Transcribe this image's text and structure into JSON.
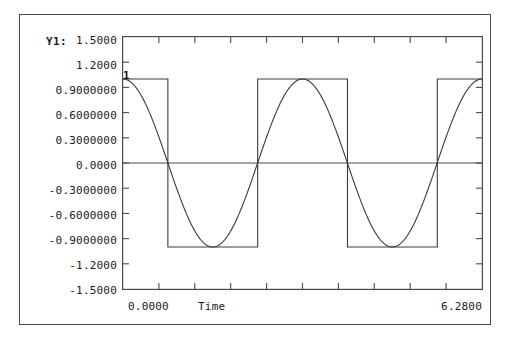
{
  "window": {
    "series_legend_label": "Y1:",
    "title": "Wal(4,theta),Cos(2*omega*theta).",
    "amplitude_marker": "1"
  },
  "axes": {
    "y_tick_labels": [
      "1.5000",
      "1.2000",
      "0.9000000",
      "0.6000000",
      "0.3000000",
      "0.0000",
      "-0.3000000",
      "-0.6000000",
      "-0.9000000",
      "-1.2000",
      "-1.5000"
    ],
    "x_min_label": "0.0000",
    "x_axis_title": "Time",
    "x_max_label": "6.2800"
  },
  "colors": {
    "frame": "#4a4a4a",
    "trace": "#333333",
    "text": "#1a1a1a",
    "background": "#ffffff"
  },
  "chart_data": {
    "type": "line",
    "title": "Wal(4,theta),Cos(2*omega*theta).",
    "xlabel": "Time",
    "ylabel": "Y1:",
    "xlim": [
      0.0,
      6.28
    ],
    "ylim": [
      -1.5,
      1.5
    ],
    "grid": false,
    "legend_position": "top-right",
    "y_ticks": [
      -1.5,
      -1.2,
      -0.9,
      -0.6,
      -0.3,
      0.0,
      0.3,
      0.6,
      0.9,
      1.2,
      1.5
    ],
    "y_tick_labels": [
      "-1.5000",
      "-1.2000",
      "-0.9000000",
      "-0.6000000",
      "-0.3000000",
      "0.0000",
      "0.3000000",
      "0.6000000",
      "0.9000000",
      "1.2000",
      "1.5000"
    ],
    "x_ticks": [
      0.0,
      0.628,
      1.256,
      1.884,
      2.512,
      3.14,
      3.768,
      4.396,
      5.024,
      5.652,
      6.28
    ],
    "x_tick_labels": [
      "0.0000",
      "",
      "",
      "",
      "",
      "",
      "",
      "",
      "",
      "",
      "6.2800"
    ],
    "series": [
      {
        "name": "Wal(4,theta)",
        "kind": "square",
        "amplitude": 1.0,
        "cycles": 2,
        "description": "Walsh function order 4: square wave alternating +1 / -1, transitions at theta = pi/4, 3pi/4, 5pi/4, 7pi/4 of each of 2 cycles",
        "transitions_x": [
          0.785,
          2.356,
          3.927,
          5.498
        ],
        "values_at_transitions": [
          1,
          -1,
          1,
          -1,
          1
        ]
      },
      {
        "name": "Cos(2*omega*theta)",
        "kind": "cosine",
        "amplitude": 1.0,
        "cycles": 2,
        "description": "Cosine of doubled angular frequency over 0 to 2pi giving 2 full periods",
        "zero_crossings_x": [
          0.785,
          2.356,
          3.927,
          5.498
        ],
        "maxima_x": [
          0.0,
          3.14,
          6.28
        ],
        "minima_x": [
          1.571,
          4.712
        ]
      }
    ]
  }
}
